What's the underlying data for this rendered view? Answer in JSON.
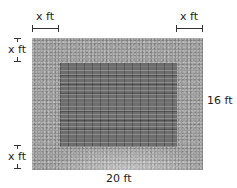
{
  "diagram": {
    "labels": {
      "top_left_width": "x ft",
      "top_right_width": "x ft",
      "left_top_height": "x ft",
      "left_bottom_height": "x ft",
      "outer_height": "16 ft",
      "outer_width": "20 ft"
    },
    "regions": {
      "outer": "grass/gravel border",
      "inner": "brick patio"
    },
    "colors": {
      "border": "#9a9a9a",
      "patio": "#6e6e6e",
      "lines": "#333333"
    }
  }
}
